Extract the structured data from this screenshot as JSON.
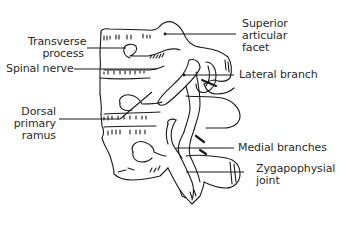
{
  "figure": {
    "colors": {
      "background": "#ffffff",
      "line": "#1a1a1a",
      "text": "#2a2a2a"
    }
  },
  "labels": {
    "transverse_process": {
      "line1": "Transverse",
      "line2": "process"
    },
    "spinal_nerve": {
      "line1": "Spinal nerve"
    },
    "dorsal_primary_ramus": {
      "line1": "Dorsal",
      "line2": "primary",
      "line3": "ramus"
    },
    "superior_articular_facet": {
      "line1": "Superior",
      "line2": "articular",
      "line3": "facet"
    },
    "lateral_branch": {
      "line1": "Lateral branch"
    },
    "medial_branches": {
      "line1": "Medial branches"
    },
    "zygapophysial_joint": {
      "line1": "Zygapophysial",
      "line2": "joint"
    }
  }
}
